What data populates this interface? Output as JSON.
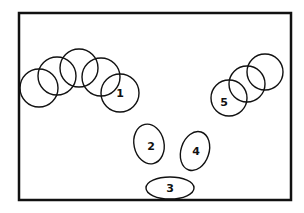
{
  "diagram": {
    "frame": {
      "x": 19,
      "y": 13,
      "width": 272,
      "height": 187,
      "stroke": "#111"
    },
    "left_group": {
      "circles": [
        {
          "cx": 39,
          "cy": 88,
          "r": 19,
          "label": ""
        },
        {
          "cx": 57,
          "cy": 76,
          "r": 19,
          "label": ""
        },
        {
          "cx": 79,
          "cy": 68,
          "r": 19,
          "label": ""
        },
        {
          "cx": 101,
          "cy": 77,
          "r": 19,
          "label": ""
        },
        {
          "cx": 120,
          "cy": 93,
          "r": 19,
          "label": "1"
        }
      ]
    },
    "right_group": {
      "circles": [
        {
          "cx": 229,
          "cy": 98,
          "r": 18,
          "label": "5"
        },
        {
          "cx": 247,
          "cy": 84,
          "r": 18,
          "label": ""
        },
        {
          "cx": 265,
          "cy": 72,
          "r": 18,
          "label": ""
        }
      ]
    },
    "ellipses": [
      {
        "cx": 149,
        "cy": 144,
        "rx": 15,
        "ry": 20,
        "rotate": -12,
        "label": "2"
      },
      {
        "cx": 195,
        "cy": 151,
        "rx": 15,
        "ry": 20,
        "rotate": 18,
        "label": "4"
      },
      {
        "cx": 170,
        "cy": 188,
        "rx": 24,
        "ry": 11,
        "rotate": 0,
        "label": "3"
      }
    ]
  }
}
